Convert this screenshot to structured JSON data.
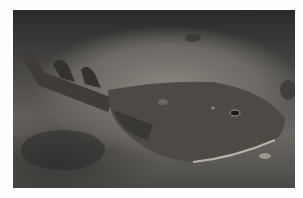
{
  "image": {
    "description": "Electric ray (torpedo) resting on sandy seafloor at night, dark vignette",
    "subject": "electric ray",
    "background": "sandy sea bottom",
    "colors": {
      "border": "#fdfdfd",
      "sand_dark": "#2a2a29",
      "sand_light": "#8a8680",
      "ray_body": "#4d4a46",
      "ray_edge": "#b9b3aa"
    }
  }
}
